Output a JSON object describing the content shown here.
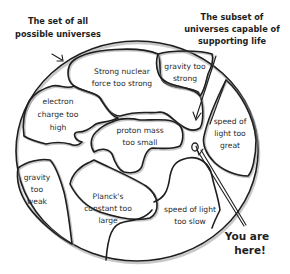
{
  "diagram": {
    "title_outer": {
      "line1": "The set of all",
      "line2": "possible universes"
    },
    "title_subset": {
      "line1": "The subset of",
      "line2": "universes capable of",
      "line3": "supporting life"
    },
    "you_are_here": {
      "line1": "You are",
      "line2": "here!"
    },
    "regions": [
      {
        "id": "strong-nuclear",
        "line1": "Strong nuclear",
        "line2": "force too strong"
      },
      {
        "id": "gravity-strong",
        "line1": "gravity too",
        "line2": "strong"
      },
      {
        "id": "electron-charge",
        "line1": "electron",
        "line2": "charge too",
        "line3": "high"
      },
      {
        "id": "proton-mass",
        "line1": "proton mass",
        "line2": "too small"
      },
      {
        "id": "speed-great",
        "line1": "speed of",
        "line2": "light too",
        "line3": "great"
      },
      {
        "id": "gravity-weak",
        "line1": "gravity",
        "line2": "too",
        "line3": "weak"
      },
      {
        "id": "planck",
        "line1": "Planck's",
        "line2": "constant too",
        "line3": "large"
      },
      {
        "id": "speed-slow",
        "line1": "speed of light",
        "line2": "too slow"
      }
    ],
    "colors": {
      "stroke": "#1e1e1e",
      "text": "#2a2a2a",
      "background": "#ffffff"
    }
  }
}
